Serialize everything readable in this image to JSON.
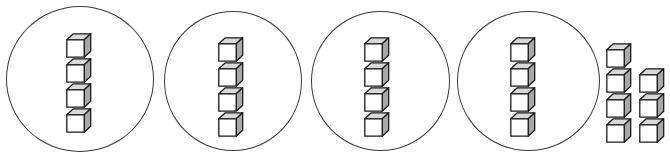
{
  "diagram": {
    "type": "base-ten-grouping",
    "canvas": {
      "width": 670,
      "height": 158
    },
    "cube": {
      "face_front_color": "#ffffff",
      "face_top_color": "#d9d9d9",
      "face_right_color": "#a8a8a8",
      "outline_color": "#1a1a1a",
      "size_px": 26
    },
    "circle": {
      "outline_color": "#3a3a3a",
      "fill_color": "transparent",
      "stroke_width_px": 1.6
    },
    "groups": [
      {
        "name": "group-1",
        "cube_count": 4,
        "circled": true,
        "circle_left": 6,
        "circle_top": 6,
        "circle_width": 148,
        "circle_height": 146,
        "stack_left": 66,
        "stack_top": 33,
        "cubes": [
          {
            "x": 0,
            "y": 0
          },
          {
            "x": 0,
            "y": 25
          },
          {
            "x": 0,
            "y": 50
          },
          {
            "x": 0,
            "y": 75
          }
        ]
      },
      {
        "name": "group-2",
        "cube_count": 4,
        "circled": true,
        "circle_left": 164,
        "circle_top": 11,
        "circle_width": 138,
        "circle_height": 140,
        "stack_left": 218,
        "stack_top": 37,
        "cubes": [
          {
            "x": 0,
            "y": 0
          },
          {
            "x": 0,
            "y": 25
          },
          {
            "x": 0,
            "y": 50
          },
          {
            "x": 0,
            "y": 75
          }
        ]
      },
      {
        "name": "group-3",
        "cube_count": 4,
        "circled": true,
        "circle_left": 311,
        "circle_top": 11,
        "circle_width": 139,
        "circle_height": 140,
        "stack_left": 364,
        "stack_top": 37,
        "cubes": [
          {
            "x": 0,
            "y": 0
          },
          {
            "x": 0,
            "y": 25
          },
          {
            "x": 0,
            "y": 50
          },
          {
            "x": 0,
            "y": 75
          }
        ]
      },
      {
        "name": "group-4",
        "cube_count": 4,
        "circled": true,
        "circle_left": 457,
        "circle_top": 11,
        "circle_width": 143,
        "circle_height": 140,
        "stack_left": 510,
        "stack_top": 37,
        "cubes": [
          {
            "x": 0,
            "y": 0
          },
          {
            "x": 0,
            "y": 25
          },
          {
            "x": 0,
            "y": 50
          },
          {
            "x": 0,
            "y": 75
          }
        ]
      }
    ],
    "loose": {
      "name": "loose-cubes",
      "cube_count": 7,
      "circled": false,
      "left": 606,
      "top": 43,
      "rows": [
        {
          "row_index": 0,
          "columns": [
            0
          ]
        },
        {
          "row_index": 1,
          "columns": [
            0,
            1
          ]
        },
        {
          "row_index": 2,
          "columns": [
            0,
            1
          ]
        },
        {
          "row_index": 3,
          "columns": [
            0,
            1
          ]
        }
      ],
      "cubes": [
        {
          "x": 0,
          "y": 0
        },
        {
          "x": 0,
          "y": 25
        },
        {
          "x": 33,
          "y": 25
        },
        {
          "x": 0,
          "y": 50
        },
        {
          "x": 33,
          "y": 50
        },
        {
          "x": 0,
          "y": 75
        },
        {
          "x": 33,
          "y": 75
        }
      ]
    },
    "totals": {
      "groups_count": 4,
      "cubes_per_group": 4,
      "grouped_cubes": 16,
      "loose_cubes": 7,
      "total_cubes": 23
    }
  }
}
